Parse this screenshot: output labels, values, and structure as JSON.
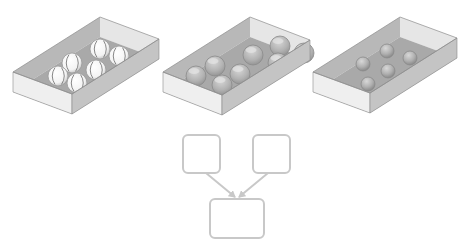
{
  "diagram": {
    "colors": {
      "background": "#ffffff",
      "tray_floor": "#a9a9a9",
      "tray_inner_wall_back": "#b8b8b8",
      "tray_inner_wall_side": "#e6e6e6",
      "tray_outer_front": "#efefef",
      "tray_outer_side": "#c4c4c4",
      "tray_edge": "#8c8c8c",
      "flow_stroke": "#c8c8c8"
    },
    "trays": [
      {
        "name": "baseballs-tray",
        "item": "baseball",
        "count": 6,
        "corners": {
          "back": [
            100,
            17
          ],
          "right": [
            159,
            39
          ],
          "left": [
            13,
            72
          ],
          "front": [
            72,
            94
          ]
        },
        "wall_height": 20,
        "ball_radius": 10,
        "balls": [
          [
            100,
            43
          ],
          [
            119,
            50
          ],
          [
            72,
            57
          ],
          [
            96,
            64
          ],
          [
            58,
            70
          ],
          [
            77,
            77
          ]
        ]
      },
      {
        "name": "glass-spheres-tray",
        "item": "glass-sphere",
        "count": 8,
        "corners": {
          "back": [
            250,
            17
          ],
          "right": [
            310,
            40
          ],
          "left": [
            163,
            72
          ],
          "front": [
            222,
            95
          ]
        },
        "wall_height": 20,
        "ball_radius": 10,
        "balls": [
          [
            280,
            40
          ],
          [
            304,
            47
          ],
          [
            253,
            49
          ],
          [
            278,
            57
          ],
          [
            215,
            60
          ],
          [
            240,
            68
          ],
          [
            196,
            70
          ],
          [
            222,
            79
          ]
        ]
      },
      {
        "name": "small-spheres-tray",
        "item": "gray-sphere",
        "count": 5,
        "corners": {
          "back": [
            400,
            17
          ],
          "right": [
            457,
            38
          ],
          "left": [
            313,
            72
          ],
          "front": [
            370,
            93
          ]
        },
        "wall_height": 20,
        "ball_radius": 7,
        "balls": [
          [
            387,
            45
          ],
          [
            410,
            52
          ],
          [
            363,
            58
          ],
          [
            388,
            65
          ],
          [
            368,
            78
          ]
        ]
      }
    ],
    "flowchart": {
      "nodes": [
        {
          "name": "source-box-left",
          "x": 183,
          "y": 135,
          "w": 37,
          "h": 38,
          "label": ""
        },
        {
          "name": "source-box-right",
          "x": 253,
          "y": 135,
          "w": 37,
          "h": 38,
          "label": ""
        },
        {
          "name": "target-box",
          "x": 210,
          "y": 199,
          "w": 54,
          "h": 39,
          "label": ""
        }
      ],
      "edges": [
        {
          "name": "arrow-left-to-target",
          "from": [
            206,
            173
          ],
          "to": [
            235,
            197
          ]
        },
        {
          "name": "arrow-right-to-target",
          "from": [
            268,
            173
          ],
          "to": [
            239,
            197
          ]
        }
      ]
    }
  }
}
